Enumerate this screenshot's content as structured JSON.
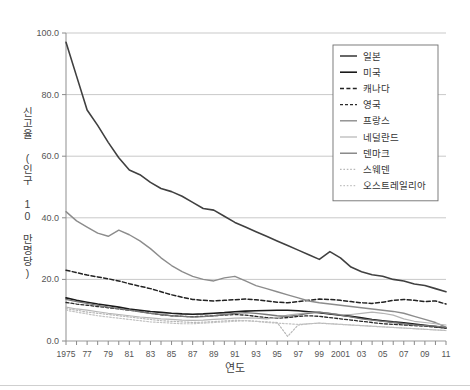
{
  "chart_data": {
    "type": "line",
    "title": "",
    "xlabel": "연도",
    "ylabel": "신고율 (인구 10 만명당)",
    "ylim": [
      0,
      100
    ],
    "yticks": [
      "0.0",
      "20.0",
      "40.0",
      "60.0",
      "80.0",
      "100.0"
    ],
    "ytick_values": [
      0,
      20,
      40,
      60,
      80,
      100
    ],
    "grid": true,
    "legend_position": "top-right",
    "x": [
      1975,
      1976,
      1977,
      1978,
      1979,
      1980,
      1981,
      1982,
      1983,
      1984,
      1985,
      1986,
      1987,
      1988,
      1989,
      1990,
      1991,
      1992,
      1993,
      1994,
      1995,
      1996,
      1997,
      1998,
      1999,
      2000,
      2001,
      2002,
      2003,
      2004,
      2005,
      2006,
      2007,
      2008,
      2009,
      2010,
      2011
    ],
    "xtick_labels": [
      "1975",
      "",
      "77",
      "",
      "79",
      "",
      "81",
      "",
      "83",
      "",
      "85",
      "",
      "87",
      "",
      "89",
      "",
      "91",
      "",
      "93",
      "",
      "95",
      "",
      "97",
      "",
      "99",
      "",
      "2001",
      "",
      "03",
      "",
      "05",
      "",
      "07",
      "",
      "09",
      "",
      "11"
    ],
    "xlim": [
      1975,
      2011
    ],
    "series": [
      {
        "name": "일본",
        "color": "#404040",
        "style": "solid",
        "width": 1.6,
        "values": [
          97.0,
          86.0,
          75.0,
          70.0,
          64.5,
          59.5,
          55.5,
          54.0,
          51.5,
          49.5,
          48.5,
          47.0,
          45.0,
          43.0,
          42.5,
          40.5,
          38.5,
          37.0,
          35.5,
          34.0,
          32.5,
          31.0,
          29.5,
          28.0,
          26.5,
          29.0,
          27.0,
          24.0,
          22.5,
          21.5,
          21.0,
          20.0,
          19.5,
          18.5,
          18.0,
          17.0,
          16.0
        ]
      },
      {
        "name": "미국",
        "color": "#1a1a1a",
        "style": "solid",
        "width": 1.6,
        "values": [
          14.0,
          13.2,
          12.6,
          12.0,
          11.5,
          11.0,
          10.4,
          10.0,
          9.6,
          9.3,
          9.0,
          8.8,
          8.7,
          8.8,
          9.0,
          9.2,
          9.5,
          9.7,
          9.8,
          9.9,
          10.0,
          10.0,
          9.8,
          9.5,
          9.2,
          8.8,
          8.4,
          8.0,
          7.5,
          7.0,
          6.6,
          6.2,
          5.9,
          5.5,
          5.1,
          4.7,
          4.2
        ]
      },
      {
        "name": "캐나다",
        "color": "#222222",
        "style": "dashed",
        "width": 1.5,
        "values": [
          23.0,
          22.2,
          21.4,
          20.8,
          20.2,
          19.5,
          18.6,
          17.8,
          17.0,
          16.0,
          15.0,
          14.2,
          13.5,
          13.2,
          13.0,
          13.2,
          13.4,
          13.6,
          13.4,
          13.0,
          12.6,
          12.4,
          12.8,
          13.2,
          13.6,
          13.5,
          13.2,
          12.8,
          12.4,
          12.2,
          12.6,
          13.2,
          13.5,
          13.2,
          12.8,
          13.0,
          12.0
        ]
      },
      {
        "name": "영국",
        "color": "#2b2b2b",
        "style": "dashed-fine",
        "width": 1.3,
        "values": [
          12.5,
          12.0,
          11.6,
          11.2,
          10.8,
          10.4,
          10.0,
          9.6,
          9.0,
          8.5,
          8.2,
          8.0,
          7.9,
          8.0,
          8.2,
          8.4,
          8.6,
          8.4,
          8.0,
          7.6,
          7.4,
          7.6,
          8.0,
          8.2,
          8.0,
          7.6,
          7.2,
          6.8,
          6.4,
          6.0,
          5.6,
          5.4,
          5.2,
          5.0,
          4.8,
          4.5,
          4.2
        ]
      },
      {
        "name": "프랑스",
        "color": "#8c8c8c",
        "style": "solid",
        "width": 1.4,
        "values": [
          42.0,
          39.0,
          37.0,
          35.0,
          34.0,
          36.0,
          34.5,
          32.5,
          30.0,
          27.0,
          24.5,
          22.5,
          21.0,
          20.0,
          19.5,
          20.5,
          21.0,
          19.5,
          18.0,
          17.0,
          16.0,
          15.0,
          14.0,
          13.0,
          12.4,
          12.0,
          11.6,
          11.2,
          10.8,
          10.4,
          10.0,
          9.6,
          9.0,
          8.0,
          7.0,
          6.0,
          4.5
        ]
      },
      {
        "name": "네덜란드",
        "color": "#b5b5b5",
        "style": "solid",
        "width": 1.2,
        "values": [
          11.0,
          10.4,
          10.0,
          9.5,
          9.0,
          8.6,
          8.2,
          7.8,
          7.5,
          7.2,
          7.0,
          6.8,
          6.7,
          6.8,
          7.0,
          7.2,
          7.4,
          7.5,
          7.4,
          7.2,
          7.6,
          8.4,
          8.8,
          9.2,
          9.4,
          9.0,
          8.6,
          8.6,
          9.0,
          9.4,
          9.0,
          8.4,
          7.2,
          6.4,
          6.0,
          5.6,
          5.2
        ]
      },
      {
        "name": "덴마크",
        "color": "#777777",
        "style": "solid",
        "width": 1.3,
        "values": [
          13.5,
          12.8,
          12.2,
          11.6,
          11.0,
          10.5,
          10.0,
          9.5,
          9.0,
          8.6,
          8.2,
          8.0,
          7.8,
          7.9,
          8.2,
          8.6,
          9.0,
          9.2,
          9.0,
          8.6,
          8.2,
          8.0,
          8.4,
          9.0,
          9.4,
          9.0,
          8.4,
          7.8,
          7.2,
          6.8,
          6.4,
          6.0,
          5.6,
          5.2,
          5.0,
          4.8,
          4.4
        ]
      },
      {
        "name": "스웨덴",
        "color": "#b8b8b8",
        "style": "dotted",
        "width": 1.2,
        "values": [
          10.5,
          10.0,
          9.4,
          9.0,
          8.6,
          8.2,
          7.8,
          7.4,
          7.0,
          6.6,
          6.4,
          6.2,
          6.0,
          6.1,
          6.3,
          6.5,
          6.7,
          6.6,
          6.4,
          6.2,
          6.0,
          1.5,
          5.2,
          5.6,
          5.8,
          5.6,
          5.4,
          5.2,
          5.0,
          4.8,
          4.6,
          4.4,
          4.2,
          4.0,
          3.8,
          3.6,
          3.4
        ]
      },
      {
        "name": "오스트레일리아",
        "color": "#c2c2c2",
        "style": "dotted",
        "width": 1.2,
        "values": [
          10.0,
          9.4,
          8.8,
          8.2,
          7.8,
          7.4,
          7.0,
          6.6,
          6.2,
          6.0,
          5.8,
          5.6,
          5.6,
          5.8,
          6.0,
          6.2,
          6.4,
          6.6,
          6.4,
          6.0,
          5.8,
          5.6,
          5.4,
          5.6,
          5.8,
          5.6,
          5.4,
          5.2,
          5.0,
          4.8,
          4.6,
          4.4,
          4.2,
          4.0,
          3.8,
          3.6,
          3.4
        ]
      }
    ]
  },
  "axes": {
    "y_title": "신고율 (인구 10 만명당)",
    "x_title": "연도"
  }
}
